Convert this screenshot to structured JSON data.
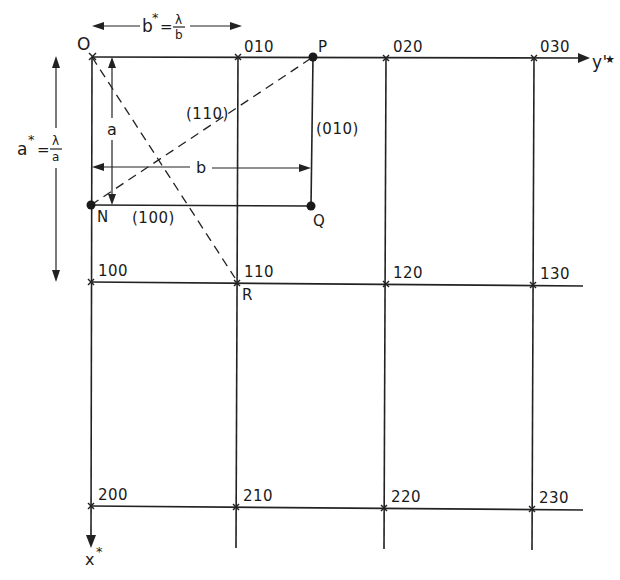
{
  "diagram": {
    "axes": {
      "y_axis_label": "y'",
      "y_axis_star": "★",
      "x_axis_label": "x",
      "x_axis_star": "*"
    },
    "dimension_labels": {
      "b_star_lhs": "b",
      "b_star_sup": "*",
      "b_star_eq": "=",
      "b_star_num": "λ",
      "b_star_den": "b",
      "a_star_lhs": "a",
      "a_star_sup": "*",
      "a_star_eq": "=",
      "a_star_num": "λ",
      "a_star_den": "a",
      "a_label": "a",
      "b_label": "b"
    },
    "points": {
      "O": "O",
      "N": "N",
      "P": "P",
      "Q": "Q",
      "R": "R"
    },
    "planes": {
      "p100": "(100)",
      "p010": "(010)",
      "p110": "(110)"
    },
    "lattice_nodes": [
      {
        "label": "010",
        "x": 238,
        "y": 57
      },
      {
        "label": "020",
        "x": 386,
        "y": 58
      },
      {
        "label": "030",
        "x": 534,
        "y": 58
      },
      {
        "label": "100",
        "x": 91,
        "y": 282
      },
      {
        "label": "110",
        "x": 237,
        "y": 283
      },
      {
        "label": "120",
        "x": 386,
        "y": 284
      },
      {
        "label": "130",
        "x": 533,
        "y": 285
      },
      {
        "label": "200",
        "x": 91,
        "y": 506
      },
      {
        "label": "210",
        "x": 236,
        "y": 507
      },
      {
        "label": "220",
        "x": 384,
        "y": 508
      },
      {
        "label": "230",
        "x": 532,
        "y": 509
      }
    ]
  }
}
